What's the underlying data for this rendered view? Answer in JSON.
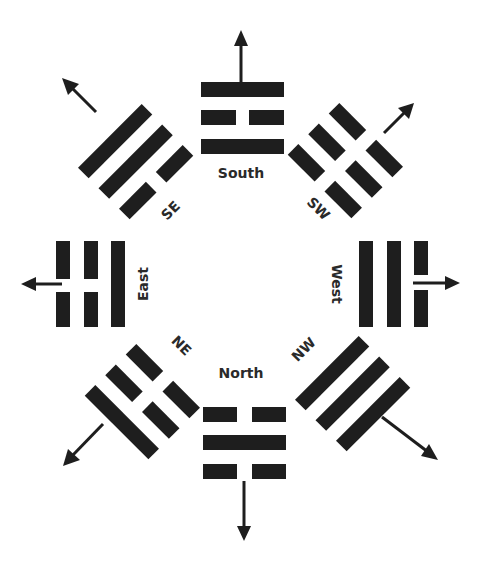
{
  "diagram": {
    "type": "bagua-directions",
    "colors": {
      "ink": "#1e1e1e",
      "label": "#2a2a2a",
      "background": "#ffffff"
    },
    "trigrams": [
      {
        "id": "south",
        "label": "South",
        "lines_outer_to_inner": [
          "solid",
          "broken",
          "solid"
        ],
        "arrow": "up"
      },
      {
        "id": "southwest",
        "label": "SW",
        "lines_outer_to_inner": [
          "broken",
          "broken",
          "broken"
        ],
        "arrow": "up-right"
      },
      {
        "id": "west",
        "label": "West",
        "lines_outer_to_inner": [
          "broken",
          "solid",
          "solid"
        ],
        "arrow": "right"
      },
      {
        "id": "northwest",
        "label": "NW",
        "lines_outer_to_inner": [
          "solid",
          "solid",
          "solid"
        ],
        "arrow": "down-right"
      },
      {
        "id": "north",
        "label": "North",
        "lines_outer_to_inner": [
          "broken",
          "solid",
          "broken"
        ],
        "arrow": "down"
      },
      {
        "id": "northeast",
        "label": "NE",
        "lines_outer_to_inner": [
          "solid",
          "broken",
          "broken"
        ],
        "arrow": "down-left"
      },
      {
        "id": "east",
        "label": "East",
        "lines_outer_to_inner": [
          "broken",
          "broken",
          "solid"
        ],
        "arrow": "left"
      },
      {
        "id": "southeast",
        "label": "SE",
        "lines_outer_to_inner": [
          "solid",
          "solid",
          "broken"
        ],
        "arrow": "up-left"
      }
    ]
  }
}
